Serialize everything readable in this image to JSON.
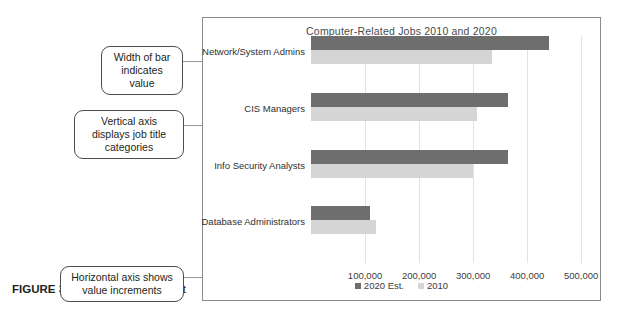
{
  "figure": {
    "number": "FIGURE 3.12",
    "title": "Clustered Bar Chart"
  },
  "callouts": [
    {
      "id": "width",
      "text": "Width of bar indicates value"
    },
    {
      "id": "vaxis",
      "text": "Vertical axis displays job title categories"
    },
    {
      "id": "haxis",
      "text": "Horizontal axis shows value increments"
    }
  ],
  "chart_data": {
    "type": "bar",
    "orientation": "horizontal",
    "title": "Computer-Related Jobs 2010 and 2020",
    "xlabel": "",
    "ylabel": "",
    "categories": [
      "Network/System Admins",
      "CIS Managers",
      "Info Security Analysts",
      "Database Administrators"
    ],
    "series": [
      {
        "name": "2020 Est.",
        "color": "#6e6e6e",
        "values": [
          440000,
          365000,
          365000,
          110000
        ]
      },
      {
        "name": "2010",
        "color": "#d5d5d5",
        "values": [
          335000,
          308000,
          300000,
          120000
        ]
      }
    ],
    "xlim": [
      0,
      520000
    ],
    "xticks": [
      100000,
      200000,
      300000,
      400000,
      500000
    ],
    "xtick_labels": [
      "100,000",
      "200,000",
      "300,000",
      "400,000",
      "500,000"
    ],
    "grid": true,
    "legend_position": "bottom"
  }
}
